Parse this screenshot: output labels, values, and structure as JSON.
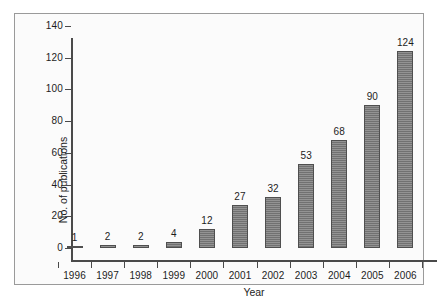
{
  "chart_data": {
    "type": "bar",
    "title": "",
    "subtitle": "",
    "xlabel": "Year",
    "ylabel": "No. of publications",
    "categories": [
      "1996",
      "1997",
      "1998",
      "1999",
      "2000",
      "2001",
      "2002",
      "2003",
      "2004",
      "2005",
      "2006"
    ],
    "values": [
      1,
      2,
      2,
      4,
      12,
      27,
      32,
      53,
      68,
      90,
      124
    ],
    "data_labels": [
      "1",
      "2",
      "2",
      "4",
      "12",
      "27",
      "32",
      "53",
      "68",
      "90",
      "124"
    ],
    "ylim": [
      0,
      140
    ],
    "yticks": [
      0,
      20,
      40,
      60,
      80,
      100,
      120,
      140
    ],
    "ytick_labels": [
      "0",
      "20",
      "40",
      "60",
      "80",
      "100",
      "120",
      "140"
    ],
    "grid": false,
    "legend": null,
    "legend_position": "none",
    "series": [
      {
        "name": "No. of publications",
        "values": [
          1,
          2,
          2,
          4,
          12,
          27,
          32,
          53,
          68,
          90,
          124
        ],
        "color": "#787878"
      }
    ],
    "colors": {
      "bar_fill": "#787878",
      "bar_edge": "#4f4f4f",
      "axis": "#4a4a4a",
      "text": "#1d1d1d",
      "figure_background": "#fbfbfb",
      "frame_border": "#9a9a9a"
    }
  }
}
